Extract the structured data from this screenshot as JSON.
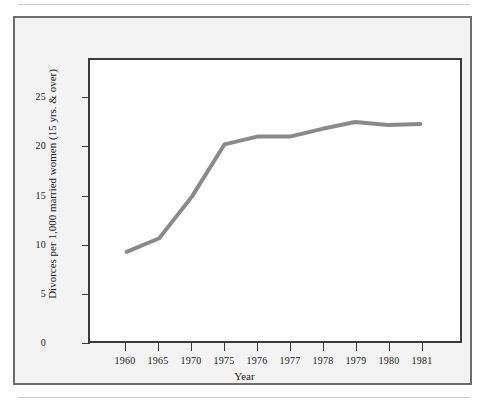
{
  "figure": {
    "background_color": "#f3f3f3",
    "frame_color": "#6e6e6e",
    "plot_frame_color": "#3a3a3a"
  },
  "chart_data": {
    "type": "line",
    "title": "",
    "subtitle": "",
    "xlabel": "Year",
    "ylabel": "Divorces per 1,000 married women (15 yrs. & over)",
    "categories": [
      "1960",
      "1965",
      "1970",
      "1975",
      "1976",
      "1977",
      "1978",
      "1979",
      "1980",
      "1981"
    ],
    "values": [
      9.2,
      10.6,
      14.9,
      20.3,
      21.1,
      21.1,
      21.9,
      22.6,
      22.3,
      22.4
    ],
    "series": [
      {
        "name": "Divorce rate",
        "color": "#8a8a8a",
        "line_width": 4,
        "values": [
          9.2,
          10.6,
          14.9,
          20.3,
          21.1,
          21.1,
          21.9,
          22.6,
          22.3,
          22.4
        ]
      }
    ],
    "ylim": [
      0,
      29
    ],
    "yticks": [
      0,
      5,
      10,
      15,
      20,
      25
    ],
    "ytick_labels": [
      "0",
      "5",
      "10",
      "15",
      "20",
      "25"
    ],
    "xtick_labels": [
      "1960",
      "1965",
      "1970",
      "1975",
      "1976",
      "1977",
      "1978",
      "1979",
      "1980",
      "1981"
    ],
    "grid": false,
    "legend": false,
    "legend_position": "none",
    "markers": false,
    "annotations": []
  }
}
